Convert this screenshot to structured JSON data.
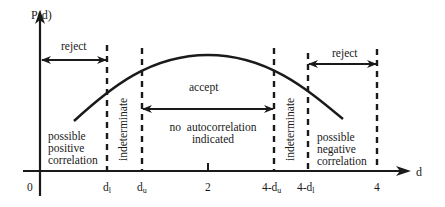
{
  "diagram": {
    "y_axis_label": "P(d)",
    "x_axis_label": "d",
    "origin_label": "0",
    "tick_labels": [
      {
        "id": "dl",
        "base": "d",
        "sub": "l"
      },
      {
        "id": "du",
        "base": "d",
        "sub": "u"
      },
      {
        "id": "two",
        "base": "2",
        "sub": ""
      },
      {
        "id": "four_minus_du",
        "base": "4-d",
        "sub": "u"
      },
      {
        "id": "four_minus_dl",
        "base": "4-d",
        "sub": "l"
      },
      {
        "id": "four",
        "base": "4",
        "sub": ""
      }
    ],
    "regions": {
      "reject_left": "reject",
      "reject_right": "reject",
      "accept": "accept",
      "indeterminate_left": "indeterminate",
      "indeterminate_right": "indeterminate",
      "positive": [
        "possible",
        "positive",
        "correlation"
      ],
      "negative": [
        "possible",
        "negative",
        "correlation"
      ],
      "no_autocorr": [
        "no  autocorrelation",
        "indicated"
      ]
    },
    "colors": {
      "ink": "#1a1a1a",
      "background": "#ffffff"
    }
  }
}
